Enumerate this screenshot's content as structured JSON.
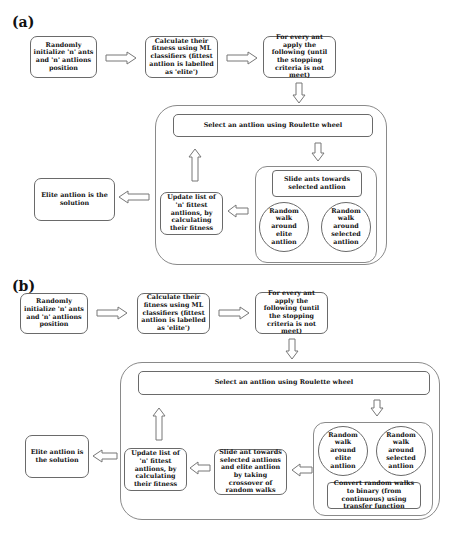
{
  "panel_a": {
    "label": "(a)",
    "init": "Randomly initialize 'n' ants and 'n' antlions position",
    "fitness": "Calculate their fitness using ML classifiers (fittest antlion is labelled as 'elite')",
    "loop": "For every ant apply the following (until the stopping criteria is not meet)",
    "select": "Select an antlion using Roulette wheel",
    "slide": "Slide ants towards selected antlion",
    "walk_elite": "Random walk around elite antlion",
    "walk_selected": "Random walk around selected antlion",
    "update": "Update list of 'n' fittest antlions, by calculating their fitness",
    "solution": "Elite antlion is the solution"
  },
  "panel_b": {
    "label": "(b)",
    "init": "Randomly initialize 'n' ants and 'n' antlions position",
    "fitness": "Calculate their fitness using ML classifiers (fittest antlion is labelled as 'elite')",
    "loop": "For every ant apply the following (until the stopping criteria is not meet)",
    "select": "Select an antlion using Roulette wheel",
    "walk_elite": "Random walk around elite antlion",
    "walk_selected": "Random walk around selected antlion",
    "convert": "Convert random walks to binary (from continuous) using transfer function",
    "slide": "Slide ant towards selected antlions and elite antlion by taking crossover of random walks",
    "update": "Update list of 'n' fittest antlions, by calculating their fitness",
    "solution": "Elite antlion is the solution"
  }
}
